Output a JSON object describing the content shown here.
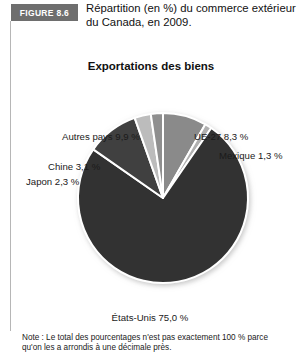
{
  "figure": {
    "badge_label": "FIGURE 8.6",
    "title": "Répartition (en %) du commerce extérieur du Canada, en 2009."
  },
  "chart_data": {
    "type": "pie",
    "title": "Exportations des biens",
    "subtitle": "",
    "xlabel": "",
    "ylabel": "",
    "unit": "%",
    "legend_position": "none",
    "grid": false,
    "start_angle_deg": 0,
    "direction": "clockwise",
    "categories": [
      "UE-27",
      "Mexique",
      "États-Unis",
      "Autres pays",
      "Chine",
      "Japon"
    ],
    "values": [
      8.3,
      1.3,
      75.0,
      9.9,
      3.1,
      2.3
    ],
    "labels": [
      "UE-27 8,3 %",
      "Mexique 1,3 %",
      "États-Unis 75,0 %",
      "Autres pays 9,9 %",
      "Chine 3,1 %",
      "Japon 2,3 %"
    ],
    "colors": [
      "#8a8a8a",
      "#b0b0b0",
      "#333333",
      "#3f3f3f",
      "#bcbcbc",
      "#8f8f8f"
    ],
    "slice_separator_color": "#ffffff",
    "annotations": [
      "Note : Le total des pourcentages n'est pas exactement 100 % parce qu'on les a arrondis à une décimale près."
    ]
  },
  "labels": {
    "ue27": "UE-27 8,3 %",
    "mexique": "Mexique 1,3 %",
    "etats_unis": "États-Unis 75,0 %",
    "autres_pays": "Autres pays 9,9 %",
    "chine": "Chine 3,1 %",
    "japon": "Japon 2,3 %"
  },
  "footnote": {
    "text": "Note : Le total des pourcentages n'est pas exactement 100 % parce qu'on les a arrondis à une décimale près."
  }
}
